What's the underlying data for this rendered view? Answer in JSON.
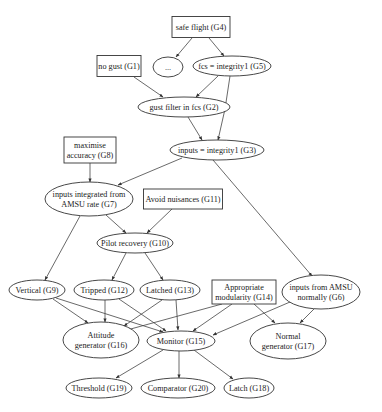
{
  "diagram": {
    "type": "goal-structure-graph",
    "nodes": [
      {
        "id": "G4",
        "shape": "box",
        "lines": [
          "safe flight (G4)"
        ],
        "cx": 201,
        "cy": 27,
        "w": 58,
        "h": 21
      },
      {
        "id": "dots",
        "shape": "ellipse",
        "lines": [
          "..."
        ],
        "cx": 168,
        "cy": 67,
        "rx": 15,
        "ry": 10
      },
      {
        "id": "G5",
        "shape": "ellipse",
        "lines": [
          "fcs = integrity1 (G5)"
        ],
        "cx": 232,
        "cy": 66,
        "rx": 39,
        "ry": 10
      },
      {
        "id": "G1",
        "shape": "box",
        "lines": [
          "no gust (G1)"
        ],
        "cx": 119,
        "cy": 66,
        "w": 44,
        "h": 21
      },
      {
        "id": "G2",
        "shape": "ellipse",
        "lines": [
          "gust filter in fcs (G2)"
        ],
        "cx": 184,
        "cy": 107,
        "rx": 46,
        "ry": 10
      },
      {
        "id": "G3",
        "shape": "ellipse",
        "lines": [
          "inputs = integrity1 (G3)"
        ],
        "cx": 217,
        "cy": 150,
        "rx": 47,
        "ry": 10
      },
      {
        "id": "G8",
        "shape": "box",
        "lines": [
          "maximise",
          "accuracy (G8)"
        ],
        "cx": 90,
        "cy": 150,
        "w": 52,
        "h": 26
      },
      {
        "id": "G7",
        "shape": "ellipse",
        "lines": [
          "inputs integrated from",
          "AMSU rate (G7)"
        ],
        "cx": 89,
        "cy": 199,
        "rx": 44,
        "ry": 17
      },
      {
        "id": "G11",
        "shape": "box",
        "lines": [
          "Avoid nuisances (G11)"
        ],
        "cx": 183,
        "cy": 199,
        "w": 79,
        "h": 20
      },
      {
        "id": "G10",
        "shape": "ellipse",
        "lines": [
          "Pilot recovery (G10)"
        ],
        "cx": 135,
        "cy": 243,
        "rx": 38,
        "ry": 10
      },
      {
        "id": "G9",
        "shape": "ellipse",
        "lines": [
          "Vertical (G9)"
        ],
        "cx": 37,
        "cy": 290,
        "rx": 28,
        "ry": 10
      },
      {
        "id": "G12",
        "shape": "ellipse",
        "lines": [
          "Tripped (G12)"
        ],
        "cx": 104,
        "cy": 290,
        "rx": 30,
        "ry": 10
      },
      {
        "id": "G13",
        "shape": "ellipse",
        "lines": [
          "Latched (G13)"
        ],
        "cx": 170,
        "cy": 290,
        "rx": 30,
        "ry": 10
      },
      {
        "id": "G14",
        "shape": "box",
        "lines": [
          "Appropriate",
          "modularity (G14)"
        ],
        "cx": 244,
        "cy": 292,
        "w": 64,
        "h": 24
      },
      {
        "id": "G6",
        "shape": "ellipse",
        "lines": [
          "inputs from AMSU",
          "normally (G6)"
        ],
        "cx": 321,
        "cy": 292,
        "rx": 39,
        "ry": 17
      },
      {
        "id": "G16",
        "shape": "ellipse",
        "lines": [
          "Attitude",
          "generator (G16)"
        ],
        "cx": 101,
        "cy": 340,
        "rx": 38,
        "ry": 18
      },
      {
        "id": "G15",
        "shape": "ellipse",
        "lines": [
          "Monitor (G15)"
        ],
        "cx": 181,
        "cy": 341,
        "rx": 34,
        "ry": 10
      },
      {
        "id": "G17",
        "shape": "ellipse",
        "lines": [
          "Normal",
          "generator (G17)"
        ],
        "cx": 288,
        "cy": 341,
        "rx": 38,
        "ry": 18
      },
      {
        "id": "G19",
        "shape": "ellipse",
        "lines": [
          "Threshold (G19)"
        ],
        "cx": 99,
        "cy": 388,
        "rx": 33,
        "ry": 10
      },
      {
        "id": "G20",
        "shape": "ellipse",
        "lines": [
          "Comparator (G20)"
        ],
        "cx": 178,
        "cy": 388,
        "rx": 37,
        "ry": 10
      },
      {
        "id": "G18",
        "shape": "ellipse",
        "lines": [
          "Latch (G18)"
        ],
        "cx": 249,
        "cy": 388,
        "rx": 25,
        "ry": 10
      }
    ],
    "edges": [
      {
        "from": "G4",
        "to": "dots",
        "points": [
          [
            192,
            38
          ],
          [
            176,
            57
          ]
        ]
      },
      {
        "from": "G4",
        "to": "G5",
        "points": [
          [
            209,
            38
          ],
          [
            224,
            56
          ]
        ]
      },
      {
        "from": "G1",
        "to": "G2",
        "points": [
          [
            134,
            77
          ],
          [
            163,
            97
          ]
        ]
      },
      {
        "from": "G5",
        "to": "G2",
        "points": [
          [
            218,
            76
          ],
          [
            196,
            97
          ]
        ]
      },
      {
        "from": "G2",
        "to": "G3",
        "points": [
          [
            188,
            117
          ],
          [
            202,
            140
          ]
        ]
      },
      {
        "from": "G5",
        "to": "G3",
        "points": [
          [
            230,
            76
          ],
          [
            226,
            110
          ],
          [
            218,
            140
          ]
        ]
      },
      {
        "from": "G3",
        "to": "G7",
        "points": [
          [
            182,
            158
          ],
          [
            118,
            185
          ]
        ]
      },
      {
        "from": "G8",
        "to": "G7",
        "points": [
          [
            90,
            163
          ],
          [
            90,
            182
          ]
        ]
      },
      {
        "from": "G3",
        "to": "G6",
        "points": [
          [
            213,
            160
          ],
          [
            312,
            276
          ]
        ]
      },
      {
        "from": "G7",
        "to": "G10",
        "points": [
          [
            106,
            215
          ],
          [
            126,
            233
          ]
        ]
      },
      {
        "from": "G11",
        "to": "G10",
        "points": [
          [
            172,
            209
          ],
          [
            147,
            233
          ]
        ]
      },
      {
        "from": "G7",
        "to": "G9",
        "points": [
          [
            80,
            216
          ],
          [
            45,
            280
          ]
        ]
      },
      {
        "from": "G10",
        "to": "G12",
        "points": [
          [
            126,
            253
          ],
          [
            112,
            280
          ]
        ]
      },
      {
        "from": "G10",
        "to": "G13",
        "points": [
          [
            145,
            253
          ],
          [
            163,
            280
          ]
        ]
      },
      {
        "from": "G9",
        "to": "G16",
        "points": [
          [
            53,
            299
          ],
          [
            88,
            323
          ]
        ]
      },
      {
        "from": "G9",
        "to": "G15",
        "points": [
          [
            56,
            298
          ],
          [
            163,
            332
          ]
        ]
      },
      {
        "from": "G12",
        "to": "G16",
        "points": [
          [
            105,
            300
          ],
          [
            105,
            322
          ]
        ]
      },
      {
        "from": "G12",
        "to": "G15",
        "points": [
          [
            119,
            299
          ],
          [
            166,
            331
          ]
        ]
      },
      {
        "from": "G13",
        "to": "G16",
        "points": [
          [
            162,
            300
          ],
          [
            124,
            326
          ]
        ]
      },
      {
        "from": "G13",
        "to": "G15",
        "points": [
          [
            176,
            300
          ],
          [
            178,
            330
          ]
        ]
      },
      {
        "from": "G14",
        "to": "G16",
        "points": [
          [
            222,
            304
          ],
          [
            127,
            330
          ]
        ]
      },
      {
        "from": "G14",
        "to": "G15",
        "points": [
          [
            232,
            304
          ],
          [
            193,
            331
          ]
        ]
      },
      {
        "from": "G14",
        "to": "G17",
        "points": [
          [
            254,
            304
          ],
          [
            275,
            323
          ]
        ]
      },
      {
        "from": "G6",
        "to": "G15",
        "points": [
          [
            290,
            302
          ],
          [
            213,
            335
          ]
        ]
      },
      {
        "from": "G6",
        "to": "G17",
        "points": [
          [
            314,
            309
          ],
          [
            300,
            323
          ]
        ]
      },
      {
        "from": "G15",
        "to": "G19",
        "points": [
          [
            163,
            350
          ],
          [
            116,
            378
          ]
        ]
      },
      {
        "from": "G15",
        "to": "G20",
        "points": [
          [
            179,
            351
          ],
          [
            179,
            378
          ]
        ]
      },
      {
        "from": "G15",
        "to": "G18",
        "points": [
          [
            194,
            350
          ],
          [
            233,
            379
          ]
        ]
      }
    ]
  }
}
